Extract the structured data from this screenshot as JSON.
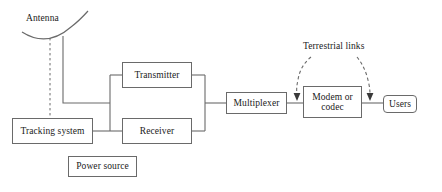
{
  "diagram": {
    "stroke_color": "#6a6a6a",
    "text_color": "#1a1a1a",
    "background": "#ffffff",
    "labels": {
      "antenna": "Antenna",
      "terrestrial_links": "Terrestrial links"
    },
    "nodes": {
      "tracking_system": "Tracking system",
      "transmitter": "Transmitter",
      "receiver": "Receiver",
      "power_source": "Power source",
      "multiplexer": "Multiplexer",
      "modem_line1": "Modem or",
      "modem_line2": "codec",
      "users": "Users"
    }
  }
}
